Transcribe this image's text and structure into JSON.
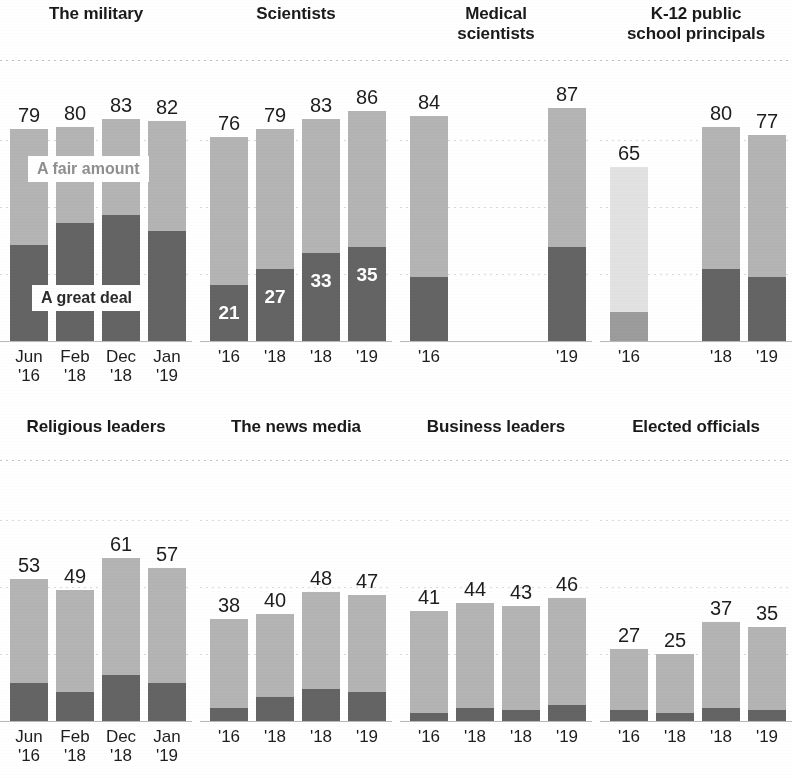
{
  "legend": {
    "fair_label": "A fair amount",
    "great_label": "A great deal",
    "fair_color": "#b4b4b4",
    "great_color": "#646464",
    "faded_fair_color": "#e2e2e2",
    "faded_great_color": "#9c9c9c"
  },
  "panels": [
    {
      "title": "The military",
      "row": 0,
      "col": 0,
      "ticks": [
        "Jun\n'16",
        "Feb\n'18",
        "Dec\n'18",
        "Jan\n'19"
      ],
      "totals": [
        79,
        80,
        83,
        82
      ],
      "great": [
        36,
        44,
        47,
        41
      ],
      "fair": [
        43,
        36,
        36,
        41
      ],
      "show_great_label": [
        false,
        false,
        false,
        false
      ],
      "faded": [
        false,
        false,
        false,
        false
      ]
    },
    {
      "title": "Scientists",
      "row": 0,
      "col": 1,
      "ticks": [
        "'16",
        "'18",
        "'18",
        "'19"
      ],
      "totals": [
        76,
        79,
        83,
        86
      ],
      "great": [
        21,
        27,
        33,
        35
      ],
      "fair": [
        55,
        52,
        50,
        51
      ],
      "show_great_label": [
        true,
        true,
        true,
        true
      ],
      "faded": [
        false,
        false,
        false,
        false
      ]
    },
    {
      "title": "Medical\nscientists",
      "row": 0,
      "col": 2,
      "ticks": [
        "'16",
        "",
        "",
        "'19"
      ],
      "totals": [
        84,
        null,
        null,
        87
      ],
      "great": [
        24,
        null,
        null,
        35
      ],
      "fair": [
        60,
        null,
        null,
        52
      ],
      "show_great_label": [
        false,
        false,
        false,
        false
      ],
      "faded": [
        false,
        false,
        false,
        false
      ]
    },
    {
      "title": "K-12 public\nschool principals",
      "row": 0,
      "col": 3,
      "ticks": [
        "'16",
        "",
        "'18",
        "'19"
      ],
      "totals": [
        65,
        null,
        80,
        77
      ],
      "great": [
        11,
        null,
        27,
        24
      ],
      "fair": [
        54,
        null,
        53,
        53
      ],
      "show_great_label": [
        false,
        false,
        false,
        false
      ],
      "faded": [
        true,
        false,
        false,
        false
      ]
    },
    {
      "title": "Religious leaders",
      "row": 1,
      "col": 0,
      "ticks": [
        "Jun\n'16",
        "Feb\n'18",
        "Dec\n'18",
        "Jan\n'19"
      ],
      "totals": [
        53,
        49,
        61,
        57
      ],
      "great": [
        14,
        11,
        17,
        14
      ],
      "fair": [
        39,
        38,
        44,
        43
      ],
      "show_great_label": [
        false,
        false,
        false,
        false
      ],
      "faded": [
        false,
        false,
        false,
        false
      ]
    },
    {
      "title": "The news media",
      "row": 1,
      "col": 1,
      "ticks": [
        "'16",
        "'18",
        "'18",
        "'19"
      ],
      "totals": [
        38,
        40,
        48,
        47
      ],
      "great": [
        5,
        9,
        12,
        11
      ],
      "fair": [
        33,
        31,
        36,
        36
      ],
      "show_great_label": [
        false,
        false,
        false,
        false
      ],
      "faded": [
        false,
        false,
        false,
        false
      ]
    },
    {
      "title": "Business leaders",
      "row": 1,
      "col": 2,
      "ticks": [
        "'16",
        "'18",
        "'18",
        "'19"
      ],
      "totals": [
        41,
        44,
        43,
        46
      ],
      "great": [
        3,
        5,
        4,
        6
      ],
      "fair": [
        38,
        39,
        39,
        40
      ],
      "show_great_label": [
        false,
        false,
        false,
        false
      ],
      "faded": [
        false,
        false,
        false,
        false
      ]
    },
    {
      "title": "Elected officials",
      "row": 1,
      "col": 3,
      "ticks": [
        "'16",
        "'18",
        "'18",
        "'19"
      ],
      "totals": [
        27,
        25,
        37,
        35
      ],
      "great": [
        4,
        3,
        5,
        4
      ],
      "fair": [
        23,
        22,
        32,
        31
      ],
      "show_great_label": [
        false,
        false,
        false,
        false
      ],
      "faded": [
        false,
        false,
        false,
        false
      ]
    }
  ],
  "chart_data": {
    "type": "bar",
    "title": "",
    "subtitle": "",
    "xlabel": "",
    "ylabel": "",
    "ylim": [
      0,
      100
    ],
    "grid": true,
    "stacked": true,
    "legend_position": "inline-overlay",
    "legend": [
      "A fair amount",
      "A great deal"
    ],
    "series": [
      {
        "name": "A great deal",
        "color": "#646464"
      },
      {
        "name": "A fair amount",
        "color": "#b4b4b4"
      }
    ],
    "panels": [
      {
        "name": "The military",
        "categories": [
          "Jun '16",
          "Feb '18",
          "Dec '18",
          "Jan '19"
        ],
        "total": [
          79,
          80,
          83,
          82
        ],
        "a_great_deal": [
          36,
          44,
          47,
          41
        ],
        "a_fair_amount": [
          43,
          36,
          36,
          41
        ]
      },
      {
        "name": "Scientists",
        "categories": [
          "'16",
          "'18",
          "'18",
          "'19"
        ],
        "total": [
          76,
          79,
          83,
          86
        ],
        "a_great_deal": [
          21,
          27,
          33,
          35
        ],
        "a_fair_amount": [
          55,
          52,
          50,
          51
        ]
      },
      {
        "name": "Medical scientists",
        "categories": [
          "'16",
          "'19"
        ],
        "total": [
          84,
          87
        ],
        "a_great_deal": [
          24,
          35
        ],
        "a_fair_amount": [
          60,
          52
        ]
      },
      {
        "name": "K-12 public school principals",
        "categories": [
          "'16",
          "'18",
          "'19"
        ],
        "total": [
          65,
          80,
          77
        ],
        "a_great_deal": [
          11,
          27,
          24
        ],
        "a_fair_amount": [
          54,
          53,
          53
        ]
      },
      {
        "name": "Religious leaders",
        "categories": [
          "Jun '16",
          "Feb '18",
          "Dec '18",
          "Jan '19"
        ],
        "total": [
          53,
          49,
          61,
          57
        ],
        "a_great_deal": [
          14,
          11,
          17,
          14
        ],
        "a_fair_amount": [
          39,
          38,
          44,
          43
        ]
      },
      {
        "name": "The news media",
        "categories": [
          "'16",
          "'18",
          "'18",
          "'19"
        ],
        "total": [
          38,
          40,
          48,
          47
        ],
        "a_great_deal": [
          5,
          9,
          12,
          11
        ],
        "a_fair_amount": [
          33,
          31,
          36,
          36
        ]
      },
      {
        "name": "Business leaders",
        "categories": [
          "'16",
          "'18",
          "'18",
          "'19"
        ],
        "total": [
          41,
          44,
          43,
          46
        ],
        "a_great_deal": [
          3,
          5,
          4,
          6
        ],
        "a_fair_amount": [
          38,
          39,
          39,
          40
        ]
      },
      {
        "name": "Elected officials",
        "categories": [
          "'16",
          "'18",
          "'18",
          "'19"
        ],
        "total": [
          27,
          25,
          37,
          35
        ],
        "a_great_deal": [
          4,
          3,
          5,
          4
        ],
        "a_fair_amount": [
          23,
          22,
          32,
          31
        ]
      }
    ]
  }
}
